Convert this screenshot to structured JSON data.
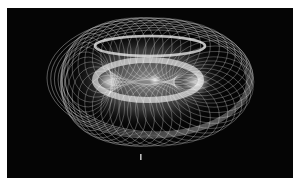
{
  "image": {
    "description": "Long-exposure light painting forming a glowing toroidal spirograph pattern on a black background",
    "background": "#050505",
    "border": "#ffffff",
    "glow_color": "#e8e8e8",
    "torus": {
      "cx": 150,
      "cy": 78,
      "rx": 103,
      "ry": 60,
      "loops": 44,
      "loop_rx": 38,
      "loop_ry": 28
    },
    "inner_ring": {
      "cx": 148,
      "cy": 74,
      "rx": 53,
      "ry": 20
    },
    "small_mark": {
      "x": 140,
      "y": 154
    }
  }
}
